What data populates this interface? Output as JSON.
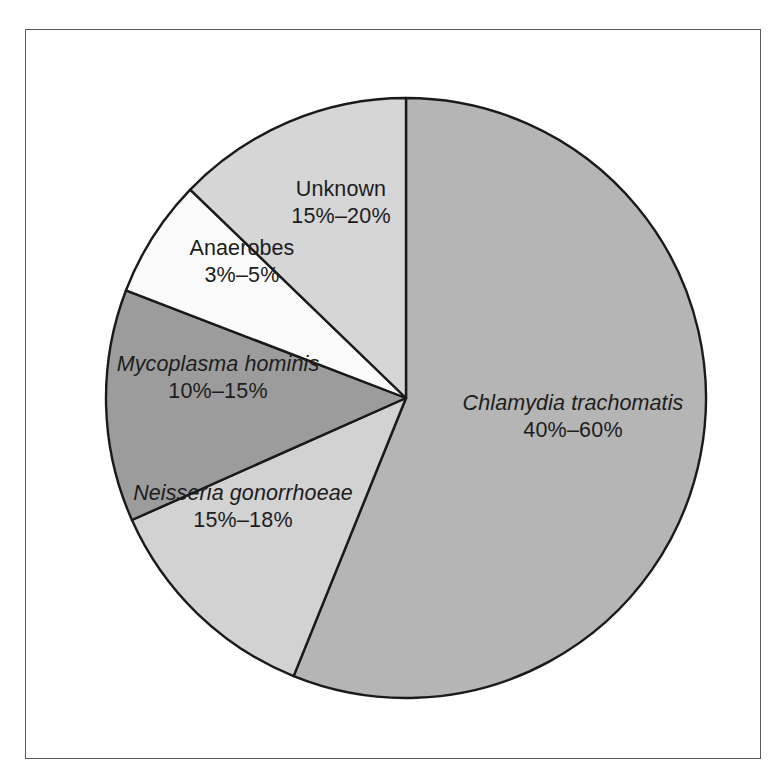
{
  "figure": {
    "background_color": "#ffffff",
    "frame_color": "#5a5a5a",
    "outline_color": "#1a1a1a"
  },
  "chart_data": {
    "type": "pie",
    "title": "",
    "subtitle": "",
    "xlabel": "",
    "ylabel": "",
    "legend_position": "none",
    "grid": false,
    "labels_on_slices": true,
    "start_angle_deg": 0,
    "direction": "clockwise",
    "categories": [
      "Chlamydia trachomatis",
      "Neisseria gonorrhoeae",
      "Mycoplasma hominis",
      "Anaerobes",
      "Unknown"
    ],
    "value_labels": [
      "40%–60%",
      "15%–18%",
      "10%–15%",
      "3%–5%",
      "15%–20%"
    ],
    "range_low": [
      40,
      15,
      10,
      3,
      15
    ],
    "range_high": [
      60,
      18,
      15,
      5,
      20
    ],
    "values": [
      56.1,
      12.2,
      12.5,
      6.4,
      12.8
    ],
    "slice_angles_deg": [
      {
        "name": "Chlamydia trachomatis",
        "start": 0,
        "end": 202
      },
      {
        "name": "Neisseria gonorrhoeae",
        "start": 202,
        "end": 246
      },
      {
        "name": "Mycoplasma hominis",
        "start": 246,
        "end": 291
      },
      {
        "name": "Anaerobes",
        "start": 291,
        "end": 314
      },
      {
        "name": "Unknown",
        "start": 314,
        "end": 360
      }
    ],
    "colors": [
      "#b5b5b5",
      "#d2d2d2",
      "#9c9c9c",
      "#fbfbfb",
      "#d6d6d6"
    ],
    "italic_labels": [
      true,
      true,
      true,
      false,
      false
    ]
  },
  "slices": {
    "chlamydia": {
      "name": "Chlamydia trachomatis",
      "value": "40%–60%",
      "color": "#b5b5b5"
    },
    "neisseria": {
      "name": "Neisseria gonorrhoeae",
      "value": "15%–18%",
      "color": "#d2d2d2"
    },
    "mycoplasma": {
      "name": "Mycoplasma hominis",
      "value": "10%–15%",
      "color": "#9c9c9c"
    },
    "anaerobes": {
      "name": "Anaerobes",
      "value": "3%–5%",
      "color": "#fbfbfb"
    },
    "unknown": {
      "name": "Unknown",
      "value": "15%–20%",
      "color": "#d6d6d6"
    }
  }
}
